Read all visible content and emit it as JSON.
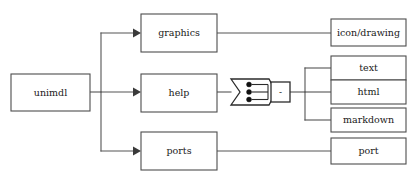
{
  "diagram": {
    "type": "block-diagram",
    "nodes": {
      "root": {
        "label": "unimdl"
      },
      "graphics": {
        "label": "graphics"
      },
      "help": {
        "label": "help"
      },
      "ports": {
        "label": "ports"
      },
      "icon_drawing": {
        "label": "icon/drawing"
      },
      "text": {
        "label": "text"
      },
      "html": {
        "label": "html"
      },
      "markdown": {
        "label": "markdown"
      },
      "port": {
        "label": "port"
      }
    },
    "selector": {
      "label": "-",
      "port_count": 3
    },
    "edges": [
      {
        "from": "unimdl",
        "to": "graphics",
        "arrow": true
      },
      {
        "from": "unimdl",
        "to": "help",
        "arrow": true
      },
      {
        "from": "unimdl",
        "to": "ports",
        "arrow": true
      },
      {
        "from": "graphics",
        "to": "icon/drawing",
        "arrow": false
      },
      {
        "from": "help",
        "to": "bus-selector",
        "arrow": false
      },
      {
        "from": "bus-selector",
        "to": "text",
        "arrow": false
      },
      {
        "from": "bus-selector",
        "to": "html",
        "arrow": false
      },
      {
        "from": "bus-selector",
        "to": "markdown",
        "arrow": false
      },
      {
        "from": "ports",
        "to": "port",
        "arrow": false
      }
    ],
    "colors": {
      "background": "#ffffff",
      "box_stroke": "#4d4d4d",
      "wire": "#555555",
      "text": "#1a1a1a",
      "bus_stroke": "#2b2b2b"
    }
  }
}
